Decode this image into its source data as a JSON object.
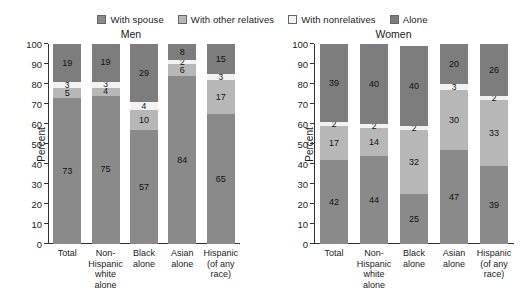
{
  "legend": {
    "items": [
      {
        "label": "With spouse",
        "color": "#8a8a8a",
        "swatch_name": "legend-swatch-with-spouse"
      },
      {
        "label": "With other relatives",
        "color": "#b7b7b7",
        "swatch_name": "legend-swatch-with-other-relatives"
      },
      {
        "label": "With nonrelatives",
        "color": "#f2f2f2",
        "swatch_name": "legend-swatch-with-nonrelatives"
      },
      {
        "label": "Alone",
        "color": "#7d7d7d",
        "swatch_name": "legend-swatch-alone"
      }
    ]
  },
  "chart_data": [
    {
      "type": "bar",
      "title": "Men",
      "xlabel": "",
      "ylabel": "Percent",
      "ylim": [
        0,
        100
      ],
      "yticks": [
        0,
        10,
        20,
        30,
        40,
        50,
        60,
        70,
        80,
        90,
        100
      ],
      "grid": false,
      "stacked": true,
      "legend_position": "top-center",
      "categories": [
        "Total",
        "Non-\nHispanic\nwhite\nalone",
        "Black\nalone",
        "Asian\nalone",
        "Hispanic\n(of any\nrace)"
      ],
      "series": [
        {
          "name": "With spouse",
          "color": "#8a8a8a",
          "values": [
            73,
            75,
            57,
            84,
            65
          ]
        },
        {
          "name": "With other relatives",
          "color": "#b7b7b7",
          "values": [
            5,
            4,
            10,
            6,
            17
          ]
        },
        {
          "name": "With nonrelatives",
          "color": "#f2f2f2",
          "values": [
            3,
            3,
            4,
            2,
            3
          ]
        },
        {
          "name": "Alone",
          "color": "#7d7d7d",
          "values": [
            19,
            19,
            29,
            8,
            15
          ]
        }
      ]
    },
    {
      "type": "bar",
      "title": "Women",
      "xlabel": "",
      "ylabel": "Percent",
      "ylim": [
        0,
        100
      ],
      "yticks": [
        0,
        10,
        20,
        30,
        40,
        50,
        60,
        70,
        80,
        90,
        100
      ],
      "grid": false,
      "stacked": true,
      "legend_position": "top-center",
      "categories": [
        "Total",
        "Non-\nHispanic\nwhite\nalone",
        "Black\nalone",
        "Asian\nalone",
        "Hispanic\n(of any\nrace)"
      ],
      "series": [
        {
          "name": "With spouse",
          "color": "#8a8a8a",
          "values": [
            42,
            44,
            25,
            47,
            39
          ]
        },
        {
          "name": "With other relatives",
          "color": "#b7b7b7",
          "values": [
            17,
            14,
            32,
            30,
            33
          ]
        },
        {
          "name": "With nonrelatives",
          "color": "#f2f2f2",
          "values": [
            2,
            2,
            2,
            3,
            2
          ]
        },
        {
          "name": "Alone",
          "color": "#7d7d7d",
          "values": [
            39,
            40,
            40,
            20,
            26
          ]
        }
      ]
    }
  ]
}
